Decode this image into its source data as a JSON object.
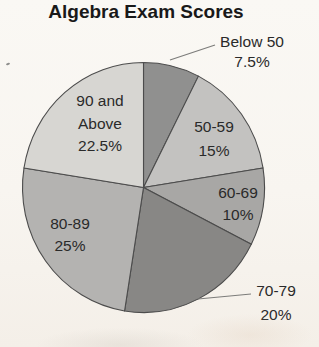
{
  "page": {
    "background_color": "#f8f5f0",
    "title_color": "#191919"
  },
  "chart_data": {
    "type": "pie",
    "title": "Algebra Exam Scores",
    "categories": [
      "Below 50",
      "50-59",
      "60-69",
      "70-79",
      "80-89",
      "90 and Above"
    ],
    "values": [
      7.5,
      15,
      10,
      20,
      25,
      22.5
    ],
    "unit": "%",
    "start_angle_deg": 0,
    "direction": "clockwise",
    "legend": "none",
    "slice_colors": [
      "#90908f",
      "#c3c2c0",
      "#a8a7a5",
      "#888785",
      "#b4b3b1",
      "#d7d6d2"
    ],
    "stroke_color": "#4c4c4c",
    "leader_line_color": "#7c7c7a",
    "labels": [
      {
        "lines": [
          "Below 50",
          "7.5%"
        ],
        "placement": "outside"
      },
      {
        "lines": [
          "50-59",
          "15%"
        ],
        "placement": "inside"
      },
      {
        "lines": [
          "60-69",
          "10%"
        ],
        "placement": "inside"
      },
      {
        "lines": [
          "70-79",
          "20%"
        ],
        "placement": "outside"
      },
      {
        "lines": [
          "80-89",
          "25%"
        ],
        "placement": "inside"
      },
      {
        "lines": [
          "90 and",
          "Above",
          "22.5%"
        ],
        "placement": "inside"
      }
    ]
  }
}
